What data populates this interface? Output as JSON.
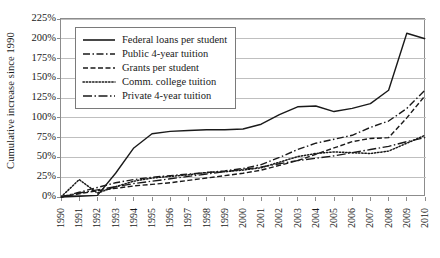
{
  "chart_data": {
    "type": "line",
    "title": "",
    "xlabel": "",
    "ylabel": "Cumulative increase since 1990",
    "x": [
      1990,
      1991,
      1992,
      1993,
      1994,
      1995,
      1996,
      1997,
      1998,
      1999,
      2000,
      2001,
      2002,
      2003,
      2004,
      2005,
      2006,
      2007,
      2008,
      2009,
      2010
    ],
    "categories": [
      "1990",
      "1991",
      "1992",
      "1993",
      "1994",
      "1995",
      "1996",
      "1997",
      "1998",
      "1999",
      "2000",
      "2001",
      "2002",
      "2003",
      "2004",
      "2005",
      "2006",
      "2007",
      "2008",
      "2009",
      "2010"
    ],
    "ylim": [
      0,
      225
    ],
    "ytick_values": [
      0,
      25,
      50,
      75,
      100,
      125,
      150,
      175,
      200,
      225
    ],
    "ytick_labels": [
      "0%",
      "25%",
      "50%",
      "75%",
      "100%",
      "125%",
      "150%",
      "175%",
      "200%",
      "225%"
    ],
    "grid": "horizontal",
    "legend_position": "upper left (inset)",
    "series": [
      {
        "name": "Federal loans per student",
        "style": "solid",
        "values": [
          0,
          1,
          2,
          30,
          62,
          80,
          83,
          84,
          85,
          85,
          86,
          92,
          104,
          114,
          115,
          108,
          112,
          118,
          135,
          207,
          200
        ]
      },
      {
        "name": "Public 4-year tuition",
        "style": "dash-dot",
        "values": [
          0,
          6,
          12,
          18,
          22,
          25,
          27,
          29,
          31,
          33,
          36,
          41,
          50,
          60,
          68,
          73,
          78,
          88,
          96,
          112,
          135
        ]
      },
      {
        "name": "Grants per student",
        "style": "dashed",
        "values": [
          0,
          4,
          8,
          11,
          14,
          16,
          18,
          21,
          24,
          27,
          30,
          34,
          40,
          46,
          54,
          62,
          70,
          74,
          75,
          100,
          128
        ]
      },
      {
        "name": "Comm. college tuition",
        "style": "dotted",
        "values": [
          0,
          22,
          5,
          13,
          20,
          24,
          26,
          28,
          31,
          32,
          34,
          37,
          44,
          51,
          55,
          57,
          56,
          55,
          58,
          68,
          78
        ]
      },
      {
        "name": "Private 4-year tuition",
        "style": "long-dash-dot",
        "values": [
          0,
          5,
          9,
          13,
          17,
          20,
          23,
          26,
          29,
          32,
          35,
          38,
          42,
          46,
          49,
          52,
          56,
          60,
          64,
          70,
          75
        ]
      }
    ]
  },
  "axis": {
    "ylabel": "Cumulative increase since 1990"
  },
  "legend": {
    "items": [
      {
        "label": "Federal loans per student"
      },
      {
        "label": "Public 4-year tuition"
      },
      {
        "label": "Grants per student"
      },
      {
        "label": "Comm. college tuition"
      },
      {
        "label": "Private 4-year tuition"
      }
    ]
  },
  "colors": {
    "line": "#1a1a1a",
    "grid": "#bfbfbf",
    "frame": "#8c8c8c",
    "background": "#ffffff"
  }
}
